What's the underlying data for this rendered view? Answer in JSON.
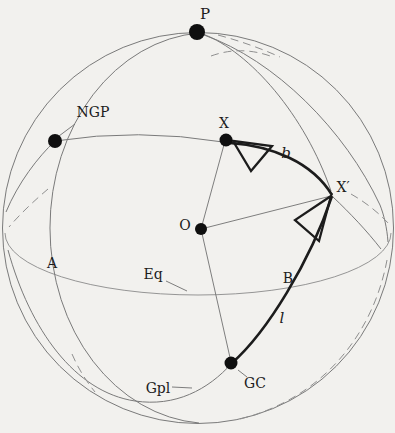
{
  "figure": {
    "background": "#f2f1ee",
    "ink": "#1c1c1c",
    "thin_arc_color": "#7a7a7a",
    "labels": {
      "pole": "P",
      "ngp": "NGP",
      "star": "X",
      "star_projection": "X′",
      "origin": "O",
      "node_a": "A",
      "equator": "Eq",
      "node_b": "B",
      "galactic_latitude": "b",
      "galactic_longitude": "l",
      "galactic_centre": "GC",
      "galactic_plane": "Gpl"
    }
  }
}
